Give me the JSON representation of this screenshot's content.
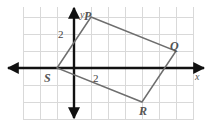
{
  "figure": {
    "type": "coordinate-plane-diagram",
    "axis_labels": {
      "x": "x",
      "y": "y"
    },
    "tick_labels": [
      {
        "name": "y-axis-tick-2",
        "text": "2",
        "axis": "y",
        "value": 2
      },
      {
        "name": "x-axis-tick-2",
        "text": "2",
        "axis": "x",
        "value": 2
      }
    ],
    "vertices": [
      {
        "label": "P",
        "x": 1,
        "y": 3
      },
      {
        "label": "Q",
        "x": 6,
        "y": 1
      },
      {
        "label": "R",
        "x": 4,
        "y": -2
      },
      {
        "label": "S",
        "x": -1,
        "y": 0
      }
    ],
    "colors": {
      "grid": "#d8d8d8",
      "axis": "#111111",
      "shape_stroke": "#6b6b6b",
      "label_text": "#4a4a4a",
      "background": "#ffffff"
    },
    "grid": {
      "visible": true,
      "spacing_units": 1,
      "x_range": [
        -3,
        8
      ],
      "y_range": [
        -3,
        4
      ]
    }
  }
}
